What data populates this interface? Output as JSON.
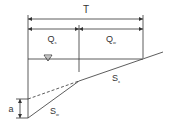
{
  "diagram": {
    "type": "composite gutter cross-section",
    "labels": {
      "top_width": "T",
      "flow_left": "Q",
      "flow_left_sub": "s",
      "flow_right": "Q",
      "flow_right_sub": "w",
      "slope_road": "S",
      "slope_road_sub": "x",
      "slope_gutter": "S",
      "slope_gutter_sub": "w",
      "depression": "a",
      "water_surface_symbol": "▽"
    },
    "colors": {
      "line": "#333333",
      "background": "#ffffff"
    }
  }
}
